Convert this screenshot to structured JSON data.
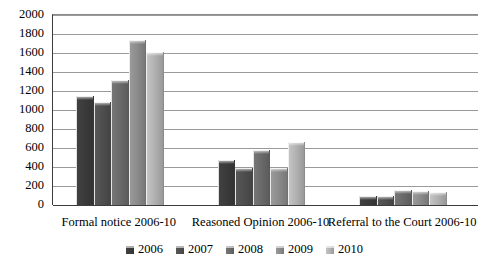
{
  "chart_data": {
    "type": "bar",
    "title": "",
    "subtitle": "",
    "xlabel": "",
    "ylabel": "",
    "ylim": [
      0,
      2000
    ],
    "ytick_step": 200,
    "yticks": [
      "2000",
      "1800",
      "1600",
      "1400",
      "1200",
      "1000",
      "800",
      "600",
      "400",
      "200",
      "0"
    ],
    "grid": true,
    "legend_position": "bottom",
    "categories": [
      "Formal notice 2006-10",
      "Reasoned Opinion 2006-10",
      "Referral to the Court 2006-10"
    ],
    "series": [
      {
        "name": "2006",
        "color": "#3b3b3b",
        "values": [
          1150,
          470,
          90
        ]
      },
      {
        "name": "2007",
        "color": "#4f4f4f",
        "values": [
          1080,
          390,
          95
        ]
      },
      {
        "name": "2008",
        "color": "#6b6b6b",
        "values": [
          1320,
          580,
          155
        ]
      },
      {
        "name": "2009",
        "color": "#8c8c8c",
        "values": [
          1740,
          390,
          150
        ]
      },
      {
        "name": "2010",
        "color": "#b2b2b2",
        "values": [
          1610,
          660,
          140
        ]
      }
    ]
  },
  "legend": {
    "items": [
      {
        "label": "2006",
        "color": "#3b3b3b"
      },
      {
        "label": "2007",
        "color": "#4f4f4f"
      },
      {
        "label": "2008",
        "color": "#6b6b6b"
      },
      {
        "label": "2009",
        "color": "#8c8c8c"
      },
      {
        "label": "2010",
        "color": "#b2b2b2"
      }
    ]
  },
  "axis": {
    "gridline_color": "#9a9a9a",
    "axis_color": "#3c3c3c"
  }
}
